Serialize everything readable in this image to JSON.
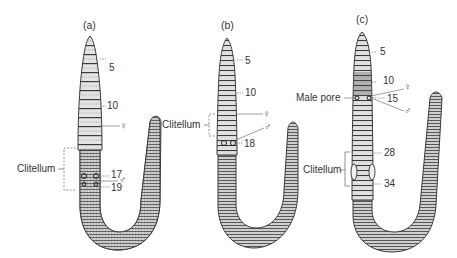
{
  "figure": {
    "panels": [
      {
        "id": "a",
        "label": "(a)",
        "segment_labels": [
          "5",
          "10",
          "17",
          "19"
        ],
        "clitellum_label": "Clitellum",
        "female_symbol": "♀",
        "male_symbol": "♂"
      },
      {
        "id": "b",
        "label": "(b)",
        "segment_labels": [
          "5",
          "10",
          "18"
        ],
        "clitellum_label": "Clitellum",
        "female_symbol": "♀",
        "male_symbol": "♂"
      },
      {
        "id": "c",
        "label": "(c)",
        "segment_labels": [
          "5",
          "10",
          "15",
          "28",
          "34"
        ],
        "male_pore_label": "Male pore",
        "clitellum_label": "Clitellum",
        "female_symbol": "♀",
        "male_symbol": "♂"
      }
    ],
    "colors": {
      "worm_fill": "#c8c8c8",
      "worm_stroke": "#3a3a3a",
      "ring_stroke": "#555555",
      "leader_line": "#777777",
      "text": "#333333"
    }
  }
}
